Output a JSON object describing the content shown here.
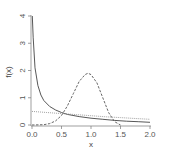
{
  "chart_data": {
    "type": "line",
    "title": "",
    "xlabel": "x",
    "ylabel": "f(x)",
    "xlim": [
      0,
      2.0
    ],
    "ylim": [
      0,
      4
    ],
    "x_ticks": [
      "0.0",
      "0.5",
      "1.0",
      "1.5",
      "2.0"
    ],
    "y_ticks": [
      "0",
      "1",
      "2",
      "3",
      "4"
    ],
    "grid": false,
    "legend": null,
    "series": [
      {
        "name": "solid",
        "style": "solid",
        "color": "#444444",
        "x": [
          0.005,
          0.02,
          0.05,
          0.1,
          0.15,
          0.2,
          0.3,
          0.4,
          0.5,
          0.6,
          0.8,
          1.0,
          1.2,
          1.4,
          1.6,
          1.8,
          2.0
        ],
        "y": [
          4.0,
          3.2,
          2.1,
          1.45,
          1.1,
          0.9,
          0.68,
          0.55,
          0.46,
          0.39,
          0.31,
          0.25,
          0.21,
          0.17,
          0.14,
          0.12,
          0.1
        ]
      },
      {
        "name": "dashed",
        "style": "dashed",
        "color": "#555555",
        "x": [
          0.0,
          0.2,
          0.3,
          0.4,
          0.5,
          0.6,
          0.7,
          0.8,
          0.9,
          0.95,
          1.0,
          1.1,
          1.2,
          1.3,
          1.4,
          1.5
        ],
        "y": [
          0.0,
          0.01,
          0.05,
          0.15,
          0.35,
          0.7,
          1.15,
          1.6,
          1.85,
          1.9,
          1.85,
          1.55,
          1.0,
          0.45,
          0.12,
          0.0
        ]
      },
      {
        "name": "dotted",
        "style": "dotted",
        "color": "#888888",
        "x": [
          0.0,
          0.25,
          0.5,
          0.75,
          1.0,
          1.25,
          1.5,
          1.75,
          2.0
        ],
        "y": [
          0.5,
          0.46,
          0.42,
          0.38,
          0.34,
          0.3,
          0.27,
          0.24,
          0.21
        ]
      }
    ]
  }
}
